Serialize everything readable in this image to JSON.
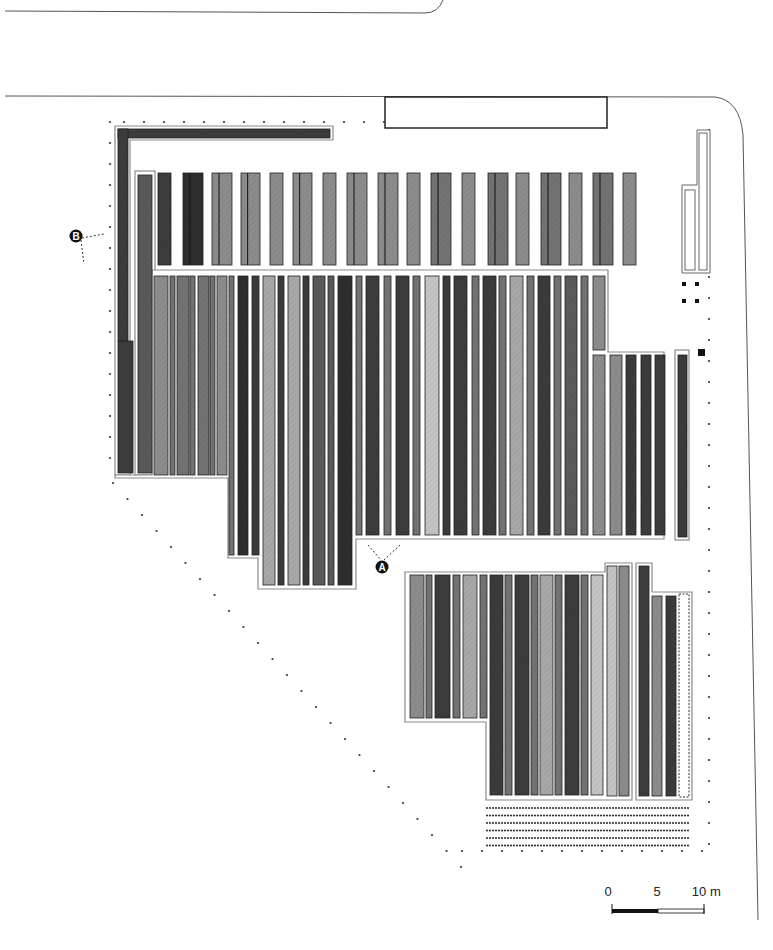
{
  "diagram": {
    "type": "site-plan",
    "background": "#ffffff",
    "palette": {
      "dark": "#3c3c3c",
      "darker": "#2e2e2e",
      "mid": "#5a5a5a",
      "midlight": "#737373",
      "light": "#8c8c8c",
      "lighter": "#a8a8a8",
      "pale": "#c4c4c4",
      "outline": "#1a1a1a",
      "frame": "#8a8a8a"
    },
    "markers": [
      {
        "id": "A",
        "label": "A",
        "x": 382,
        "y": 567
      },
      {
        "id": "B",
        "label": "B",
        "x": 76,
        "y": 236
      }
    ],
    "scale_bar": {
      "labels": [
        "0",
        "5",
        "10"
      ],
      "unit": "m"
    },
    "top_strips": [
      {
        "x": 158,
        "w": 13,
        "c": "dark",
        "split": false
      },
      {
        "x": 183,
        "w": 20,
        "c": "darker",
        "split": true
      },
      {
        "x": 212,
        "w": 20,
        "c": "light",
        "split": true
      },
      {
        "x": 241,
        "w": 19,
        "c": "light",
        "split": true
      },
      {
        "x": 270,
        "w": 13,
        "c": "light",
        "split": false
      },
      {
        "x": 293,
        "w": 19,
        "c": "light",
        "split": true
      },
      {
        "x": 323,
        "w": 13,
        "c": "light",
        "split": false
      },
      {
        "x": 347,
        "w": 20,
        "c": "light",
        "split": true
      },
      {
        "x": 378,
        "w": 20,
        "c": "light",
        "split": true
      },
      {
        "x": 407,
        "w": 13,
        "c": "light",
        "split": false
      },
      {
        "x": 431,
        "w": 20,
        "c": "midlight",
        "split": true
      },
      {
        "x": 462,
        "w": 13,
        "c": "light",
        "split": false
      },
      {
        "x": 488,
        "w": 20,
        "c": "midlight",
        "split": true
      },
      {
        "x": 516,
        "w": 13,
        "c": "light",
        "split": false
      },
      {
        "x": 541,
        "w": 20,
        "c": "midlight",
        "split": true
      },
      {
        "x": 569,
        "w": 13,
        "c": "light",
        "split": false
      },
      {
        "x": 593,
        "w": 20,
        "c": "midlight",
        "split": true
      },
      {
        "x": 623,
        "w": 13,
        "c": "light",
        "split": false
      }
    ],
    "main_strips": [
      {
        "x": 154,
        "w": 14,
        "c": "light",
        "y2": 475
      },
      {
        "x": 170,
        "w": 5,
        "c": "midlight",
        "y2": 475
      },
      {
        "x": 177,
        "w": 12,
        "c": "midlight",
        "y2": 475
      },
      {
        "x": 190,
        "w": 5,
        "c": "midlight",
        "y2": 475
      },
      {
        "x": 198,
        "w": 11,
        "c": "midlight",
        "y2": 475
      },
      {
        "x": 210,
        "w": 5,
        "c": "midlight",
        "y2": 475
      },
      {
        "x": 217,
        "w": 10,
        "c": "light",
        "y2": 475
      },
      {
        "x": 229,
        "w": 5,
        "c": "midlight",
        "y2": 555
      },
      {
        "x": 238,
        "w": 10,
        "c": "darker",
        "y2": 555
      },
      {
        "x": 252,
        "w": 7,
        "c": "dark",
        "y2": 555
      },
      {
        "x": 263,
        "w": 12,
        "c": "lighter",
        "y2": 585
      },
      {
        "x": 278,
        "w": 6,
        "c": "dark",
        "y2": 585
      },
      {
        "x": 288,
        "w": 12,
        "c": "lighter",
        "y2": 585
      },
      {
        "x": 303,
        "w": 6,
        "c": "dark",
        "y2": 585
      },
      {
        "x": 313,
        "w": 12,
        "c": "mid",
        "y2": 585
      },
      {
        "x": 328,
        "w": 6,
        "c": "mid",
        "y2": 585
      },
      {
        "x": 338,
        "w": 14,
        "c": "darker",
        "y2": 585
      },
      {
        "x": 356,
        "w": 6,
        "c": "midlight",
        "y2": 535
      },
      {
        "x": 366,
        "w": 13,
        "c": "dark",
        "y2": 535
      },
      {
        "x": 384,
        "w": 7,
        "c": "midlight",
        "y2": 535
      },
      {
        "x": 396,
        "w": 13,
        "c": "dark",
        "y2": 535
      },
      {
        "x": 413,
        "w": 7,
        "c": "midlight",
        "y2": 535
      },
      {
        "x": 425,
        "w": 14,
        "c": "pale",
        "y2": 535
      },
      {
        "x": 443,
        "w": 7,
        "c": "dark",
        "y2": 535
      },
      {
        "x": 454,
        "w": 13,
        "c": "dark",
        "y2": 535
      },
      {
        "x": 472,
        "w": 7,
        "c": "midlight",
        "y2": 535
      },
      {
        "x": 483,
        "w": 13,
        "c": "dark",
        "y2": 535
      },
      {
        "x": 499,
        "w": 7,
        "c": "midlight",
        "y2": 535
      },
      {
        "x": 510,
        "w": 13,
        "c": "lighter",
        "y2": 535
      },
      {
        "x": 527,
        "w": 7,
        "c": "midlight",
        "y2": 535
      },
      {
        "x": 538,
        "w": 12,
        "c": "dark",
        "y2": 535
      },
      {
        "x": 554,
        "w": 7,
        "c": "midlight",
        "y2": 535
      },
      {
        "x": 565,
        "w": 12,
        "c": "mid",
        "y2": 535
      },
      {
        "x": 581,
        "w": 7,
        "c": "midlight",
        "y2": 535
      },
      {
        "x": 593,
        "w": 12,
        "c": "light",
        "y2": 350
      }
    ],
    "right_lower_strips": [
      {
        "x": 593,
        "w": 12,
        "c": "light"
      },
      {
        "x": 610,
        "w": 12,
        "c": "light"
      },
      {
        "x": 626,
        "w": 10,
        "c": "dark"
      },
      {
        "x": 641,
        "w": 10,
        "c": "dark"
      },
      {
        "x": 655,
        "w": 10,
        "c": "dark"
      }
    ],
    "bottom_strips": [
      {
        "x": 410,
        "w": 14,
        "c": "light",
        "y2": 718
      },
      {
        "x": 426,
        "w": 6,
        "c": "midlight",
        "y2": 718
      },
      {
        "x": 435,
        "w": 15,
        "c": "dark",
        "y2": 718
      },
      {
        "x": 453,
        "w": 7,
        "c": "midlight",
        "y2": 718
      },
      {
        "x": 463,
        "w": 14,
        "c": "lighter",
        "y2": 718
      },
      {
        "x": 480,
        "w": 7,
        "c": "midlight",
        "y2": 718
      },
      {
        "x": 490,
        "w": 13,
        "c": "dark",
        "y2": 795
      },
      {
        "x": 505,
        "w": 7,
        "c": "midlight",
        "y2": 795
      },
      {
        "x": 515,
        "w": 14,
        "c": "dark",
        "y2": 795
      },
      {
        "x": 531,
        "w": 7,
        "c": "midlight",
        "y2": 795
      },
      {
        "x": 540,
        "w": 13,
        "c": "lighter",
        "y2": 795
      },
      {
        "x": 555,
        "w": 7,
        "c": "midlight",
        "y2": 795
      },
      {
        "x": 565,
        "w": 14,
        "c": "dark",
        "y2": 795
      },
      {
        "x": 581,
        "w": 7,
        "c": "midlight",
        "y2": 795
      },
      {
        "x": 591,
        "w": 12,
        "c": "pale",
        "y2": 795
      }
    ]
  }
}
